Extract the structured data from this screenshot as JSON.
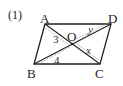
{
  "problem_label": "(1)",
  "colors": {
    "line": "#222222",
    "dotted": "#888888",
    "background": "#ffffff"
  },
  "vertices": {
    "A": {
      "label": "A",
      "x": 45,
      "y": 24
    },
    "D": {
      "label": "D",
      "x": 111,
      "y": 24
    },
    "B": {
      "label": "B",
      "x": 34,
      "y": 64
    },
    "C": {
      "label": "C",
      "x": 100,
      "y": 64
    },
    "O": {
      "label": "O",
      "x": 72,
      "y": 44
    }
  },
  "segment_labels": {
    "AO": "3",
    "OD": "y",
    "OC": "x",
    "BO": "4"
  }
}
